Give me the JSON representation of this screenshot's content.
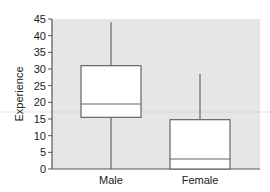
{
  "chart_data": {
    "type": "boxplot",
    "title": "",
    "xlabel": "",
    "ylabel": "Experience",
    "categories": [
      "Male",
      "Female"
    ],
    "ylim": [
      0,
      45
    ],
    "yticks": [
      0,
      5,
      10,
      15,
      20,
      25,
      30,
      35,
      40,
      45
    ],
    "grid": false,
    "legend": null,
    "series": [
      {
        "name": "Male",
        "min": 0,
        "q1": 15.5,
        "median": 19.5,
        "q3": 31,
        "max": 44
      },
      {
        "name": "Female",
        "min": 0,
        "q1": 0,
        "median": 3,
        "q3": 14.8,
        "max": 28.5
      }
    ]
  },
  "colors": {
    "plot_background": "#e6e6e6",
    "box_fill": "#ffffff",
    "line": "#666666",
    "axis": "#555555",
    "reference_line": "#d0d0d0"
  }
}
